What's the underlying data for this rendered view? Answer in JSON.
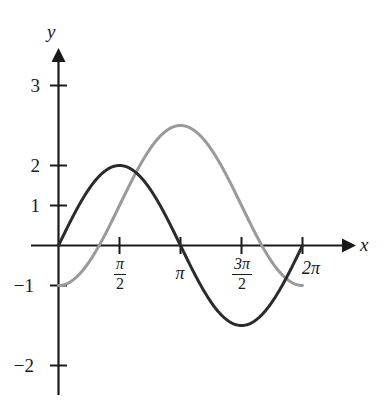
{
  "figure": {
    "background_color": "#ffffff",
    "axis_color": "#1a1a1a",
    "x_axis_label": "x",
    "y_axis_label": "y"
  },
  "chart_data": {
    "type": "line",
    "title": "",
    "xlabel": "x",
    "ylabel": "y",
    "grid": false,
    "legend": "none",
    "xlim": [
      0,
      6.283185307179586
    ],
    "ylim": [
      -2.6,
      3.4
    ],
    "x_tick_values": [
      1.5707963267948966,
      3.141592653589793,
      4.71238898038469,
      6.283185307179586
    ],
    "x_tick_labels": [
      "π/2",
      "π",
      "3π/2",
      "2π"
    ],
    "x_tick_display": [
      {
        "type": "fraction",
        "numerator": "π",
        "denominator": "2"
      },
      {
        "type": "plain",
        "text": "π"
      },
      {
        "type": "fraction",
        "numerator": "3π",
        "denominator": "2"
      },
      {
        "type": "plain",
        "text": "2π"
      }
    ],
    "y_tick_values": [
      3,
      2,
      1,
      -1,
      -2
    ],
    "y_tick_labels": [
      "3",
      "2",
      "1",
      "−1",
      "−2"
    ],
    "series": [
      {
        "name": "dark-sine",
        "color": "#2b2b2b",
        "linewidth": 3.0,
        "equation": "y = 2 sin(x)",
        "amplitude": 2,
        "vertical_shift": 0,
        "phase_shift": 0,
        "period": 6.283185307179586,
        "maximum": {
          "x": 1.5707963267948966,
          "y": 2
        },
        "minimum": {
          "x": 4.71238898038469,
          "y": -2
        },
        "x": [
          0,
          0.3141592653589793,
          0.6283185307179586,
          0.9424777960769379,
          1.2566370614359172,
          1.5707963267948966,
          1.8849555921538759,
          2.199114857512855,
          2.5132741228718345,
          2.827433388230814,
          3.141592653589793,
          3.455751918948772,
          3.7699111843077517,
          4.084070449666731,
          4.39822971502571,
          4.71238898038469,
          5.026548245743669,
          5.340707511102648,
          5.654866776461628,
          5.969026041820607,
          6.283185307179586
        ],
        "y": [
          0,
          0.618,
          1.176,
          1.618,
          1.902,
          2,
          1.902,
          1.618,
          1.176,
          0.618,
          0,
          -0.618,
          -1.176,
          -1.618,
          -1.902,
          -2,
          -1.902,
          -1.618,
          -1.176,
          -0.618,
          0
        ]
      },
      {
        "name": "gray-sine",
        "color": "#9a9a9a",
        "linewidth": 3.0,
        "equation": "y = 2 sin(x − π/2) + 1",
        "amplitude": 2,
        "vertical_shift": 1,
        "phase_shift": 1.5707963267948966,
        "period": 6.283185307179586,
        "maximum": {
          "x": 3.141592653589793,
          "y": 3
        },
        "minimum": {
          "x": 0,
          "y": -1
        },
        "x": [
          0,
          0.3141592653589793,
          0.6283185307179586,
          0.9424777960769379,
          1.2566370614359172,
          1.5707963267948966,
          1.8849555921538759,
          2.199114857512855,
          2.5132741228718345,
          2.827433388230814,
          3.141592653589793,
          3.455751918948772,
          3.7699111843077517,
          4.084070449666731,
          4.39822971502571,
          4.71238898038469,
          5.026548245743669,
          5.340707511102648,
          5.654866776461628,
          5.969026041820607,
          6.283185307179586
        ],
        "y": [
          -1,
          -0.902,
          -0.618,
          -0.176,
          0.382,
          1,
          1.618,
          2.176,
          2.618,
          2.902,
          3,
          2.902,
          2.618,
          2.176,
          1.618,
          1,
          0.382,
          -0.176,
          -0.618,
          -0.902,
          -1
        ]
      }
    ]
  },
  "y_ticks": [
    {
      "label": "3",
      "value": 3
    },
    {
      "label": "2",
      "value": 2
    },
    {
      "label": "1",
      "value": 1
    },
    {
      "label": "−1",
      "value": -1
    },
    {
      "label": "−2",
      "value": -2
    }
  ],
  "x_ticks": [
    {
      "label": "π/2",
      "numerator": "π",
      "denominator": "2"
    },
    {
      "label": "π",
      "numerator": "",
      "denominator": ""
    },
    {
      "label": "3π/2",
      "numerator": "3π",
      "denominator": "2"
    },
    {
      "label": "2π",
      "numerator": "",
      "denominator": ""
    }
  ]
}
